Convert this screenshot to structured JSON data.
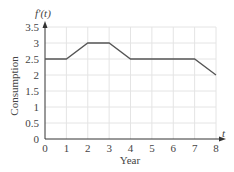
{
  "chart_data": {
    "type": "line",
    "title": "",
    "xlabel": "Year",
    "ylabel": "Consumption",
    "x_axis_symbol": "t",
    "y_axis_symbol": "f'(t)",
    "x": [
      0,
      1,
      2,
      3,
      4,
      5,
      6,
      7,
      8
    ],
    "series": [
      {
        "name": "f'(t)",
        "values": [
          2.5,
          2.5,
          3,
          3,
          2.5,
          2.5,
          2.5,
          2.5,
          2
        ]
      }
    ],
    "xlim": [
      0,
      8
    ],
    "ylim": [
      0,
      3.5
    ],
    "x_ticks": [
      "0",
      "1",
      "2",
      "3",
      "4",
      "5",
      "6",
      "7",
      "8"
    ],
    "y_ticks": [
      "0",
      "0.5",
      "1",
      "1.5",
      "2",
      "2.5",
      "3",
      "3.5"
    ],
    "grid": true,
    "legend": null,
    "colors": {
      "line": "#555555",
      "grid": "#e4e4e4",
      "axis": "#333333"
    }
  }
}
